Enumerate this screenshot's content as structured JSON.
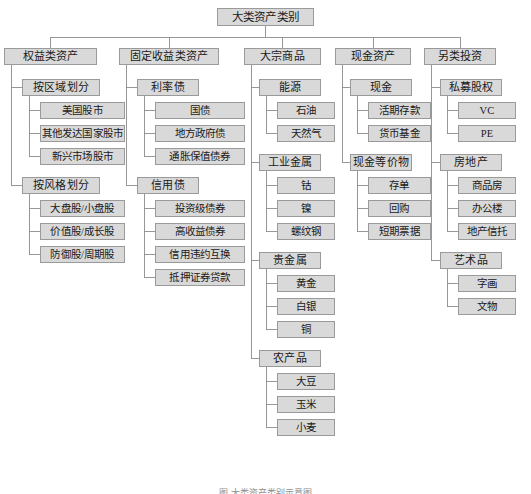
{
  "diagram": {
    "title": "大类资产类别",
    "caption": "图     大类资产类别示意图",
    "colors": {
      "node_fill": "#d9d9d9",
      "node_border": "#9a9a9a",
      "wire": "#8c8c8c",
      "text": "#1a1a1a",
      "background": "#ffffff"
    }
  },
  "root": {
    "label": "大类资产类别"
  },
  "branches": [
    {
      "label": "权益类资产",
      "groups": [
        {
          "label": "按区域划分",
          "items": [
            "美国股市",
            "其他发达国家股市",
            "新兴市场股市"
          ]
        },
        {
          "label": "按风格划分",
          "items": [
            "大盘股/小盘股",
            "价值股/成长股",
            "防御股/周期股"
          ]
        }
      ]
    },
    {
      "label": "固定收益类资产",
      "groups": [
        {
          "label": "利率债",
          "items": [
            "国债",
            "地方政府债",
            "通胀保值债券"
          ]
        },
        {
          "label": "信用债",
          "items": [
            "投资级债券",
            "高收益债券",
            "信用违约互换",
            "抵押证券贷款"
          ]
        }
      ]
    },
    {
      "label": "大宗商品",
      "groups": [
        {
          "label": "能源",
          "items": [
            "石油",
            "天然气"
          ]
        },
        {
          "label": "工业金属",
          "items": [
            "钴",
            "镍",
            "螺纹钢"
          ]
        },
        {
          "label": "贵金属",
          "items": [
            "黄金",
            "白银",
            "铜"
          ]
        },
        {
          "label": "农产品",
          "items": [
            "大豆",
            "玉米",
            "小麦"
          ]
        }
      ]
    },
    {
      "label": "现金资产",
      "groups": [
        {
          "label": "现金",
          "items": [
            "活期存款",
            "货币基金"
          ]
        },
        {
          "label": "现金等价物",
          "items": [
            "存单",
            "回购",
            "短期票据"
          ]
        }
      ]
    },
    {
      "label": "另类投资",
      "groups": [
        {
          "label": "私募股权",
          "items": [
            "VC",
            "PE"
          ]
        },
        {
          "label": "房地产",
          "items": [
            "商品房",
            "办公楼",
            "地产信托"
          ]
        },
        {
          "label": "艺术品",
          "items": [
            "字画",
            "文物"
          ]
        }
      ]
    }
  ],
  "layout": {
    "root": {
      "x": 217,
      "y": 8,
      "w": 97
    },
    "columns": [
      {
        "x": 4,
        "w": 93,
        "gx": 22,
        "gw": 78,
        "ix": 40,
        "iw": 85
      },
      {
        "x": 119,
        "w": 100,
        "gx": 137,
        "gw": 62,
        "ix": 155,
        "iw": 90
      },
      {
        "x": 244,
        "w": 77,
        "gx": 259,
        "gw": 62,
        "ix": 277,
        "iw": 58
      },
      {
        "x": 335,
        "w": 76,
        "gx": 350,
        "gw": 62,
        "ix": 368,
        "iw": 63
      },
      {
        "x": 424,
        "w": 72,
        "gx": 440,
        "gw": 62,
        "ix": 458,
        "iw": 58
      }
    ]
  }
}
